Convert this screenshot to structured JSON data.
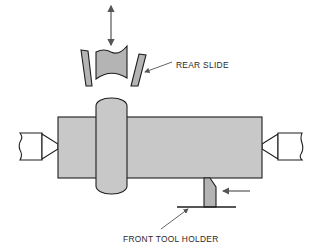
{
  "diagram": {
    "type": "centerless/plunge grinding setup - workpiece between centers",
    "labels": {
      "rear_slide": "REAR SLIDE",
      "front_tool_holder": "FRONT TOOL HOLDER"
    },
    "colors": {
      "part_fill": "#c8c8c8",
      "tool_fill": "#b4b4b4",
      "outline": "#1e1e1e",
      "arrow": "#555555",
      "background": "#ffffff"
    },
    "components": [
      {
        "id": "workpiece",
        "name": "Workpiece cylinder"
      },
      {
        "id": "collar",
        "name": "Raised collar"
      },
      {
        "id": "left-center",
        "name": "Left lathe center"
      },
      {
        "id": "right-center",
        "name": "Right lathe center"
      },
      {
        "id": "rear-slide-tools",
        "name": "Rear slide forming tools"
      },
      {
        "id": "front-tool",
        "name": "Front cutting tool"
      }
    ],
    "arrows": [
      {
        "id": "rear-feed",
        "direction": "vertical-bidirectional"
      },
      {
        "id": "front-feed",
        "direction": "left"
      }
    ]
  }
}
